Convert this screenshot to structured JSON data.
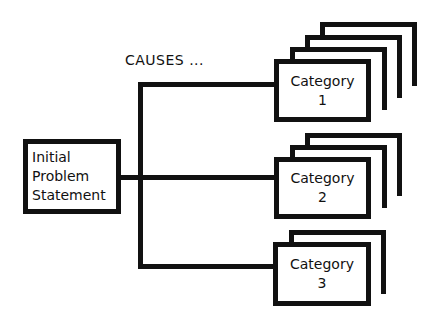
{
  "diagram": {
    "heading": "CAUSES ...",
    "problem": {
      "lines": [
        "Initial",
        "Problem",
        "Statement"
      ]
    },
    "categories": [
      {
        "title": "Category",
        "number": "1",
        "stack_layers": 3
      },
      {
        "title": "Category",
        "number": "2",
        "stack_layers": 2
      },
      {
        "title": "Category",
        "number": "3",
        "stack_layers": 1
      }
    ]
  }
}
